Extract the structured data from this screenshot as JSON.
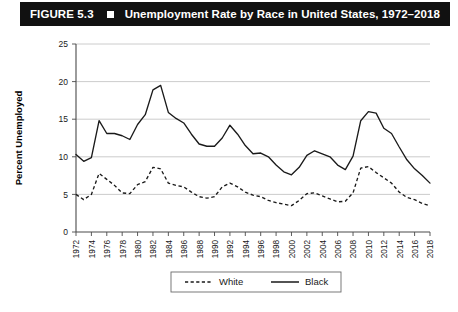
{
  "figure": {
    "number_label": "FIGURE 5.3",
    "marker_icon": "white-square-icon",
    "title": "Unemployment Rate by Race in United States, 1972–2018"
  },
  "colors": {
    "title_bar_background": "#111111",
    "title_text": "#ffffff",
    "gridline": "#bfbfbf",
    "axis": "#4a4a4a",
    "series_line": "#1a1a1a",
    "plot_background": "#ffffff"
  },
  "chart_data": {
    "type": "line",
    "title": "Unemployment Rate by Race in United States, 1972–2018",
    "xlabel": "",
    "ylabel": "Percent Unemployed",
    "ylim": [
      0,
      25
    ],
    "yticks": [
      0,
      5,
      10,
      15,
      20,
      25
    ],
    "ytick_labels": [
      "0",
      "5",
      "10",
      "15",
      "20",
      "25"
    ],
    "xlim": [
      1972,
      2018
    ],
    "xticks": [
      1972,
      1974,
      1976,
      1978,
      1980,
      1982,
      1984,
      1986,
      1988,
      1990,
      1992,
      1994,
      1996,
      1998,
      2000,
      2002,
      2004,
      2006,
      2008,
      2010,
      2012,
      2014,
      2016,
      2018
    ],
    "xtick_labels": [
      "1972",
      "1974",
      "1976",
      "1978",
      "1980",
      "1982",
      "1984",
      "1986",
      "1988",
      "1990",
      "1992",
      "1994",
      "1996",
      "1998",
      "2000",
      "2002",
      "2004",
      "2006",
      "2008",
      "2010",
      "2012",
      "2014",
      "2016",
      "2018"
    ],
    "grid": "horizontal",
    "legend_position": "bottom-center",
    "x": [
      1972,
      1973,
      1974,
      1975,
      1976,
      1977,
      1978,
      1979,
      1980,
      1981,
      1982,
      1983,
      1984,
      1985,
      1986,
      1987,
      1988,
      1989,
      1990,
      1991,
      1992,
      1993,
      1994,
      1995,
      1996,
      1997,
      1998,
      1999,
      2000,
      2001,
      2002,
      2003,
      2004,
      2005,
      2006,
      2007,
      2008,
      2009,
      2010,
      2011,
      2012,
      2013,
      2014,
      2015,
      2016,
      2017,
      2018
    ],
    "series": [
      {
        "name": "White",
        "style": "dashed",
        "values": [
          5.0,
          4.3,
          5.0,
          7.8,
          7.0,
          6.2,
          5.2,
          5.1,
          6.3,
          6.7,
          8.6,
          8.4,
          6.5,
          6.2,
          6.0,
          5.3,
          4.7,
          4.5,
          4.7,
          6.0,
          6.5,
          6.0,
          5.3,
          4.9,
          4.7,
          4.2,
          3.9,
          3.7,
          3.5,
          4.2,
          5.1,
          5.2,
          4.8,
          4.4,
          4.0,
          4.1,
          5.2,
          8.5,
          8.7,
          7.9,
          7.2,
          6.5,
          5.3,
          4.6,
          4.3,
          3.8,
          3.5
        ]
      },
      {
        "name": "Black",
        "style": "solid",
        "values": [
          10.3,
          9.4,
          9.9,
          14.8,
          13.1,
          13.1,
          12.8,
          12.3,
          14.3,
          15.6,
          18.9,
          19.5,
          15.9,
          15.1,
          14.5,
          13.0,
          11.7,
          11.4,
          11.4,
          12.5,
          14.2,
          13.0,
          11.5,
          10.4,
          10.5,
          10.0,
          8.9,
          8.0,
          7.6,
          8.6,
          10.2,
          10.8,
          10.4,
          10.0,
          8.9,
          8.3,
          10.1,
          14.8,
          16.0,
          15.8,
          13.8,
          13.1,
          11.3,
          9.6,
          8.4,
          7.5,
          6.5
        ]
      }
    ]
  },
  "legend": {
    "entries": [
      {
        "label": "White",
        "style": "dashed"
      },
      {
        "label": "Black",
        "style": "solid"
      }
    ]
  }
}
